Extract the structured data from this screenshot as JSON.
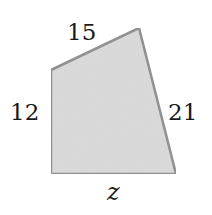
{
  "figure": {
    "type": "quadrilateral",
    "fill_color": "#d9d9d9",
    "stroke_color": "#8c8c8c",
    "vertices": [
      [
        51,
        70
      ],
      [
        139,
        28
      ],
      [
        176,
        174
      ],
      [
        51,
        174
      ]
    ],
    "sides": [
      {
        "name": "top",
        "label": "15"
      },
      {
        "name": "right",
        "label": "21"
      },
      {
        "name": "bottom",
        "label": "z"
      },
      {
        "name": "left",
        "label": "12"
      }
    ]
  }
}
